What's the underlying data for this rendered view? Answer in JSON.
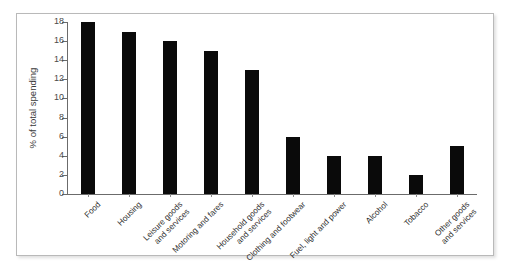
{
  "chart_data": {
    "type": "bar",
    "title": "",
    "xlabel": "",
    "ylabel": "% of total spending",
    "ylim": [
      0,
      18
    ],
    "ytick_step": 2,
    "yticks": [
      0,
      2,
      4,
      6,
      8,
      10,
      12,
      14,
      16,
      18
    ],
    "grid": false,
    "legend": false,
    "bar_color": "#0a0a0a",
    "axis_color": "#6b6b6b",
    "categories": [
      "Food",
      "Housing",
      "Leisure goods\nand services",
      "Motoring and fares",
      "Household goods\nand services",
      "Clothing and footwear",
      "Fuel, light and power",
      "Alcohol",
      "Tobacco",
      "Other goods\nand services"
    ],
    "values": [
      18,
      17,
      16,
      15,
      13,
      6,
      4,
      4,
      2,
      5
    ]
  }
}
